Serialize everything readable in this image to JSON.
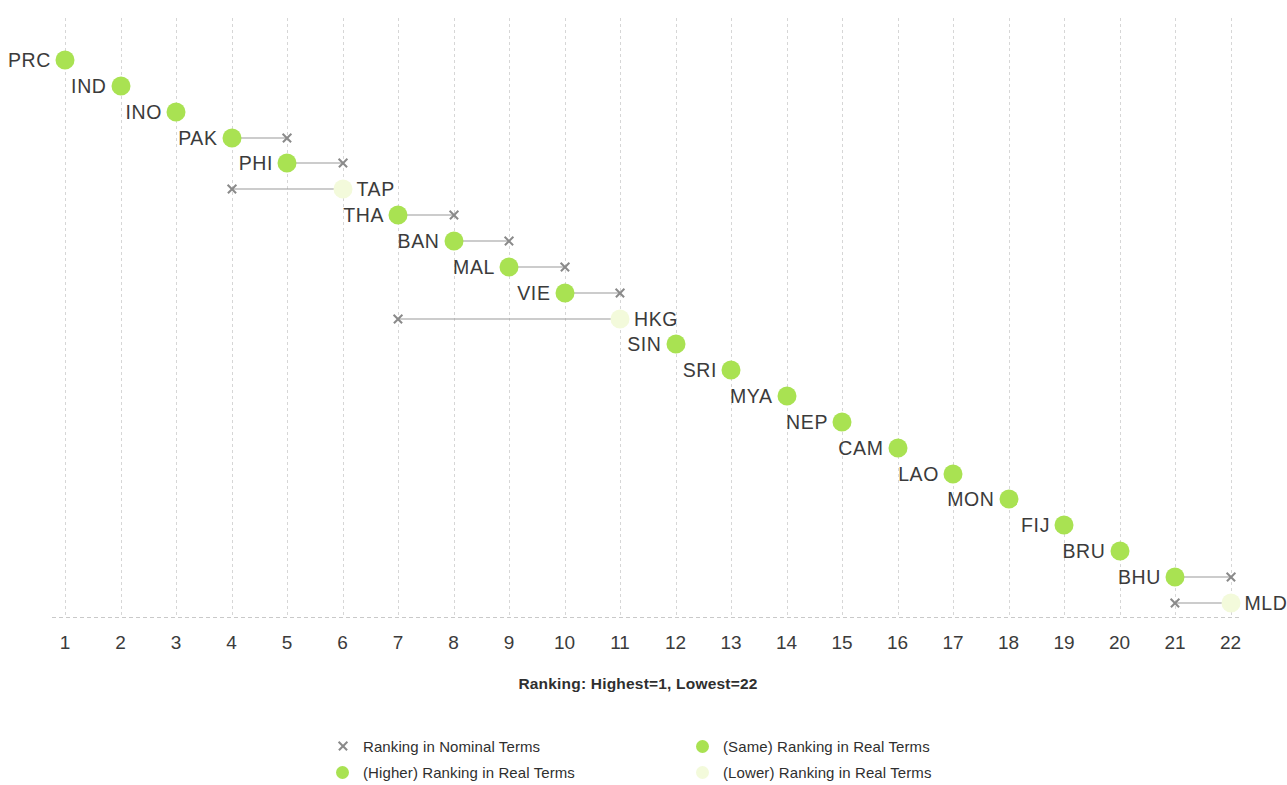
{
  "chart_data": {
    "type": "scatter",
    "title": "",
    "xlabel": "Ranking: Highest=1, Lowest=22",
    "ylabel": "",
    "xlim": [
      1,
      22
    ],
    "grid": true,
    "legend_position": "bottom",
    "x_ticks": [
      "1",
      "2",
      "3",
      "4",
      "5",
      "6",
      "7",
      "8",
      "9",
      "10",
      "11",
      "12",
      "13",
      "14",
      "15",
      "16",
      "17",
      "18",
      "19",
      "20",
      "21",
      "22"
    ],
    "colors": {
      "real_marker": "#a9e252",
      "real_marker_lower": "#f3fadb",
      "nominal_marker": "#8a8a8a",
      "connector": "#9a9a9a",
      "gridline": "#cfcfcf",
      "text": "#3b3b3b"
    },
    "categories": [
      "PRC",
      "IND",
      "INO",
      "PAK",
      "PHI",
      "TAP",
      "THA",
      "BAN",
      "MAL",
      "VIE",
      "HKG",
      "SIN",
      "SRI",
      "MYA",
      "NEP",
      "CAM",
      "LAO",
      "MON",
      "FIJ",
      "BRU",
      "BHU",
      "MLD"
    ],
    "series": [
      {
        "name": "Ranking in Real Terms",
        "values": [
          1,
          2,
          3,
          4,
          5,
          6,
          7,
          8,
          9,
          10,
          11,
          12,
          13,
          14,
          15,
          16,
          17,
          18,
          19,
          20,
          21,
          22
        ]
      },
      {
        "name": "Ranking in Nominal Terms",
        "values": [
          null,
          null,
          null,
          5,
          6,
          4,
          8,
          9,
          10,
          11,
          7,
          null,
          null,
          null,
          null,
          null,
          null,
          null,
          null,
          null,
          22,
          21
        ]
      }
    ],
    "points": [
      {
        "label": "PRC",
        "real": 1,
        "nominal": null,
        "status": "same",
        "label_side": "left"
      },
      {
        "label": "IND",
        "real": 2,
        "nominal": null,
        "status": "same",
        "label_side": "left"
      },
      {
        "label": "INO",
        "real": 3,
        "nominal": null,
        "status": "same",
        "label_side": "left"
      },
      {
        "label": "PAK",
        "real": 4,
        "nominal": 5,
        "status": "higher",
        "label_side": "left"
      },
      {
        "label": "PHI",
        "real": 5,
        "nominal": 6,
        "status": "higher",
        "label_side": "left"
      },
      {
        "label": "TAP",
        "real": 6,
        "nominal": 4,
        "status": "lower",
        "label_side": "right"
      },
      {
        "label": "THA",
        "real": 7,
        "nominal": 8,
        "status": "higher",
        "label_side": "left"
      },
      {
        "label": "BAN",
        "real": 8,
        "nominal": 9,
        "status": "higher",
        "label_side": "left"
      },
      {
        "label": "MAL",
        "real": 9,
        "nominal": 10,
        "status": "higher",
        "label_side": "left"
      },
      {
        "label": "VIE",
        "real": 10,
        "nominal": 11,
        "status": "higher",
        "label_side": "left"
      },
      {
        "label": "HKG",
        "real": 11,
        "nominal": 7,
        "status": "lower",
        "label_side": "right"
      },
      {
        "label": "SIN",
        "real": 12,
        "nominal": null,
        "status": "same",
        "label_side": "left"
      },
      {
        "label": "SRI",
        "real": 13,
        "nominal": null,
        "status": "same",
        "label_side": "left"
      },
      {
        "label": "MYA",
        "real": 14,
        "nominal": null,
        "status": "same",
        "label_side": "left"
      },
      {
        "label": "NEP",
        "real": 15,
        "nominal": null,
        "status": "same",
        "label_side": "left"
      },
      {
        "label": "CAM",
        "real": 16,
        "nominal": null,
        "status": "same",
        "label_side": "left"
      },
      {
        "label": "LAO",
        "real": 17,
        "nominal": null,
        "status": "same",
        "label_side": "left"
      },
      {
        "label": "MON",
        "real": 18,
        "nominal": null,
        "status": "same",
        "label_side": "left"
      },
      {
        "label": "FIJ",
        "real": 19,
        "nominal": null,
        "status": "same",
        "label_side": "left"
      },
      {
        "label": "BRU",
        "real": 20,
        "nominal": null,
        "status": "same",
        "label_side": "left"
      },
      {
        "label": "BHU",
        "real": 21,
        "nominal": 22,
        "status": "higher",
        "label_side": "left"
      },
      {
        "label": "MLD",
        "real": 22,
        "nominal": 21,
        "status": "lower",
        "label_side": "right"
      }
    ],
    "legend": [
      {
        "key": "nominal",
        "marker": "x",
        "label": "Ranking in Nominal Terms"
      },
      {
        "key": "same",
        "marker": "dot-same",
        "label": "(Same) Ranking in Real Terms"
      },
      {
        "key": "higher",
        "marker": "dot-higher",
        "label": "(Higher) Ranking in Real Terms"
      },
      {
        "key": "lower",
        "marker": "dot-lower",
        "label": "(Lower) Ranking in Real Terms"
      }
    ]
  }
}
